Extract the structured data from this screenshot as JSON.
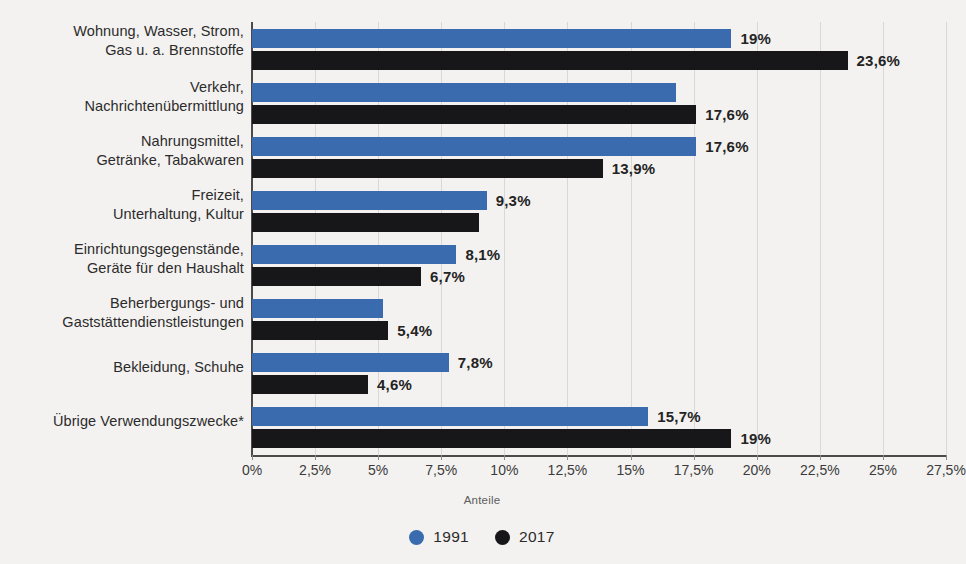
{
  "chart_data": {
    "type": "bar",
    "orientation": "horizontal",
    "title": "",
    "xlabel": "Anteile",
    "ylabel": "",
    "xlim": [
      0,
      27.5
    ],
    "xticks": [
      "0%",
      "2,5%",
      "5%",
      "7,5%",
      "10%",
      "12,5%",
      "15%",
      "17,5%",
      "20%",
      "22,5%",
      "25%",
      "27,5%"
    ],
    "xtick_values": [
      0,
      2.5,
      5,
      7.5,
      10,
      12.5,
      15,
      17.5,
      20,
      22.5,
      25,
      27.5
    ],
    "grid": true,
    "legend_position": "bottom",
    "categories": [
      "Wohnung, Wasser, Strom, Gas u. a. Brennstoffe",
      "Verkehr, Nachrichtenübermittlung",
      "Nahrungsmittel, Getränke, Tabakwaren",
      "Freizeit, Unterhaltung, Kultur",
      "Einrichtungsgegenstände, Geräte für den Haushalt",
      "Beherbergungs- und Gaststättendienstleistungen",
      "Bekleidung, Schuhe",
      "Übrige Verwendungszwecke*"
    ],
    "category_lines": [
      [
        "Wohnung, Wasser, Strom,",
        "Gas u. a. Brennstoffe"
      ],
      [
        "Verkehr,",
        "Nachrichtenübermittlung"
      ],
      [
        "Nahrungsmittel,",
        "Getränke, Tabakwaren"
      ],
      [
        "Freizeit,",
        "Unterhaltung, Kultur"
      ],
      [
        "Einrichtungsgegenstände,",
        "Geräte für den Haushalt"
      ],
      [
        "Beherbergungs- und",
        "Gaststättendienstleistungen"
      ],
      [
        "Bekleidung, Schuhe"
      ],
      [
        "Übrige Verwendungszwecke*"
      ]
    ],
    "series": [
      {
        "name": "1991",
        "color": "#3a6bae",
        "values": [
          19,
          16.8,
          17.6,
          9.3,
          8.1,
          5.2,
          7.8,
          15.7
        ],
        "labels": [
          "19%",
          "",
          "17,6%",
          "9,3%",
          "8,1%",
          "",
          "7,8%",
          "15,7%"
        ]
      },
      {
        "name": "2017",
        "color": "#17171a",
        "values": [
          23.6,
          17.6,
          13.9,
          9.0,
          6.7,
          5.4,
          4.6,
          19
        ],
        "labels": [
          "23,6%",
          "17,6%",
          "13,9%",
          "",
          "6,7%",
          "5,4%",
          "4,6%",
          "19%"
        ]
      }
    ]
  },
  "legend": {
    "items": [
      {
        "label": "1991",
        "color": "#3a6bae"
      },
      {
        "label": "2017",
        "color": "#17171a"
      }
    ]
  }
}
